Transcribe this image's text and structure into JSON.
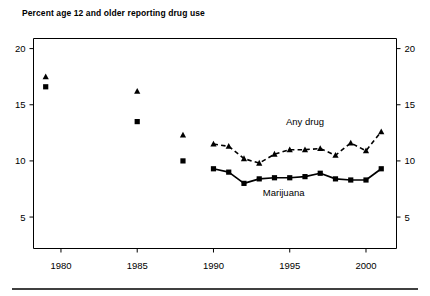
{
  "chart_data": {
    "type": "line",
    "title": "Percent age 12 and older reporting drug use",
    "xlabel": "",
    "ylabel": "",
    "xlim": [
      1978.2,
      2002.0
    ],
    "ylim": [
      2.2,
      20.9
    ],
    "grid": false,
    "legend_position": "inline-annotation",
    "xticks": [
      1980,
      1985,
      1990,
      1995,
      2000
    ],
    "xtick_labels": [
      "1980",
      "1985",
      "1990",
      "1995",
      "2000"
    ],
    "yticks": [
      5,
      10,
      15,
      20
    ],
    "ytick_labels": [
      "5",
      "10",
      "15",
      "20"
    ],
    "ytick_labels_right": [
      "5",
      "10",
      "15",
      "20"
    ],
    "annotations": [
      {
        "text": "Any drug",
        "x": 1996.0,
        "y": 13.2
      },
      {
        "text": "Marijuana",
        "x": 1994.6,
        "y": 6.9
      }
    ],
    "series": [
      {
        "name": "Any drug",
        "marker": "triangle",
        "linestyle": "dashed",
        "connected_from": 1990,
        "points": [
          {
            "x": 1979,
            "y": 17.5,
            "connected": false
          },
          {
            "x": 1985,
            "y": 16.2,
            "connected": false
          },
          {
            "x": 1988,
            "y": 12.3,
            "connected": false
          },
          {
            "x": 1990,
            "y": 11.5,
            "connected": true
          },
          {
            "x": 1991,
            "y": 11.3,
            "connected": true
          },
          {
            "x": 1992,
            "y": 10.2,
            "connected": true
          },
          {
            "x": 1993,
            "y": 9.8,
            "connected": true
          },
          {
            "x": 1994,
            "y": 10.6,
            "connected": true
          },
          {
            "x": 1995,
            "y": 11.0,
            "connected": true
          },
          {
            "x": 1996,
            "y": 11.0,
            "connected": true
          },
          {
            "x": 1997,
            "y": 11.1,
            "connected": true
          },
          {
            "x": 1998,
            "y": 10.5,
            "connected": true
          },
          {
            "x": 1999,
            "y": 11.6,
            "connected": true
          },
          {
            "x": 2000,
            "y": 10.9,
            "connected": true
          },
          {
            "x": 2001,
            "y": 12.6,
            "connected": true
          }
        ]
      },
      {
        "name": "Marijuana",
        "marker": "square",
        "linestyle": "solid",
        "connected_from": 1990,
        "points": [
          {
            "x": 1979,
            "y": 16.6,
            "connected": false
          },
          {
            "x": 1985,
            "y": 13.5,
            "connected": false
          },
          {
            "x": 1988,
            "y": 10.0,
            "connected": false
          },
          {
            "x": 1990,
            "y": 9.3,
            "connected": true
          },
          {
            "x": 1991,
            "y": 9.0,
            "connected": true
          },
          {
            "x": 1992,
            "y": 8.0,
            "connected": true
          },
          {
            "x": 1993,
            "y": 8.4,
            "connected": true
          },
          {
            "x": 1994,
            "y": 8.5,
            "connected": true
          },
          {
            "x": 1995,
            "y": 8.5,
            "connected": true
          },
          {
            "x": 1996,
            "y": 8.6,
            "connected": true
          },
          {
            "x": 1997,
            "y": 8.9,
            "connected": true
          },
          {
            "x": 1998,
            "y": 8.4,
            "connected": true
          },
          {
            "x": 1999,
            "y": 8.3,
            "connected": true
          },
          {
            "x": 2000,
            "y": 8.3,
            "connected": true
          },
          {
            "x": 2001,
            "y": 9.3,
            "connected": true
          }
        ]
      }
    ]
  }
}
